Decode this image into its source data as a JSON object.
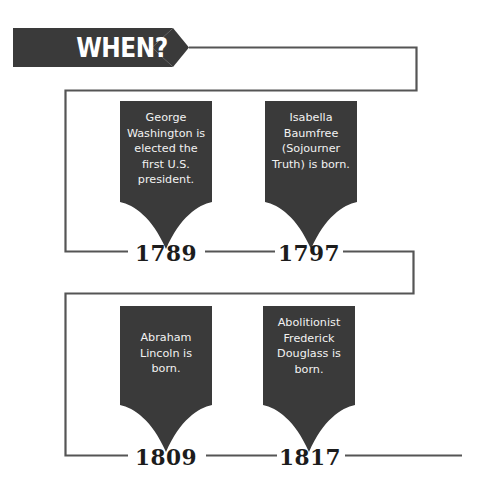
{
  "header": {
    "title": "WHEN?",
    "ribbon_color": "#3a3a3a"
  },
  "theme": {
    "banner_fill": "#3a3a3a",
    "banner_text_color": "#f2f2f2",
    "line_color": "#555555",
    "year_color": "#1c1c1c",
    "background": "#ffffff"
  },
  "timeline": {
    "rows": [
      {
        "events": [
          {
            "text": "George Washington is elected the first U.S. president.",
            "year": "1789"
          },
          {
            "text": "Isabella Baumfree (Sojourner Truth) is born.",
            "year": "1797"
          }
        ]
      },
      {
        "events": [
          {
            "text": "Abraham Lincoln is born.",
            "year": "1809"
          },
          {
            "text": "Abolitionist Frederick Douglass is born.",
            "year": "1817"
          }
        ]
      }
    ]
  }
}
